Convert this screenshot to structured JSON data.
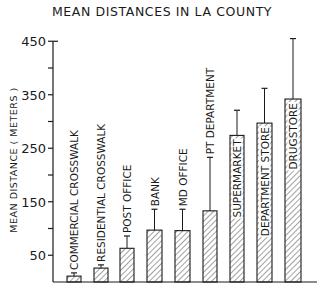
{
  "chart_data": {
    "type": "bar",
    "title": "MEAN DISTANCES IN LA COUNTY",
    "xlabel": "",
    "ylabel": "MEAN DISTANCE ( METERS )",
    "ylim": [
      0,
      450
    ],
    "yticks_labeled": [
      50,
      150,
      250,
      350,
      450
    ],
    "yticks_minor": [
      100,
      200,
      300,
      400
    ],
    "grid": false,
    "legend": null,
    "bar_fill": "diagonal-hatch",
    "error_bars": true,
    "categories": [
      "COMMERCIAL CROSSWALK",
      "RESIDENTIAL CROSSWALK",
      "POST OFFICE",
      "BANK",
      "MD OFFICE",
      "PT DEPARTMENT",
      "SUPERMARKET",
      "DEPARTMENT STORE",
      "DRUGSTORE"
    ],
    "values": [
      11,
      26,
      63,
      97,
      96,
      133,
      274,
      297,
      342
    ],
    "error_upper": [
      17,
      32,
      86,
      136,
      136,
      233,
      321,
      362,
      455
    ],
    "label_inside_bar": [
      false,
      false,
      false,
      false,
      false,
      false,
      true,
      true,
      true
    ]
  },
  "colors": {
    "ink": "#1a1a1a",
    "background": "#ffffff"
  }
}
